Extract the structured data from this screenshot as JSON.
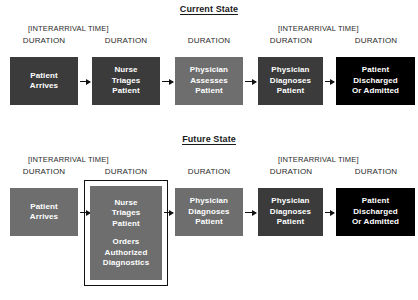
{
  "diagram": {
    "title_current": "Current State",
    "title_future": "Future State",
    "labels": {
      "interarrival": "[INTERARRIVAL TIME]",
      "duration": "DURATION"
    },
    "colors": {
      "box_dark": "#3b3b3b",
      "box_mid": "#6e6e6e",
      "box_black": "#000000",
      "text_on_box": "#ffffff",
      "line": "#111111",
      "background": "#ffffff"
    }
  },
  "current_state": {
    "title": "Current State",
    "interarrival_labels": [
      "[INTERARRIVAL TIME]",
      "[INTERARRIVAL TIME]"
    ],
    "steps": [
      {
        "id": "patient-arrives",
        "duration": "DURATION",
        "lines": [
          "Patient",
          "Arrives"
        ],
        "fill": "#3b3b3b"
      },
      {
        "id": "nurse-triages-patient",
        "duration": "DURATION",
        "lines": [
          "Nurse",
          "Triages",
          "Patient"
        ],
        "fill": "#3b3b3b"
      },
      {
        "id": "physician-assesses-patient",
        "duration": "DURATION",
        "lines": [
          "Physician",
          "Assesses",
          "Patient"
        ],
        "fill": "#6e6e6e"
      },
      {
        "id": "physician-diagnoses-patient",
        "duration": "DURATION",
        "lines": [
          "Physician",
          "Diagnoses",
          "Patient"
        ],
        "fill": "#3b3b3b"
      },
      {
        "id": "patient-discharged-or-admitted",
        "duration": "DURATION",
        "lines": [
          "Patient",
          "Discharged",
          "Or Admitted"
        ],
        "fill": "#000000"
      }
    ]
  },
  "future_state": {
    "title": "Future State",
    "interarrival_labels": [
      "[INTERARRIVAL TIME]",
      "[INTERARRIVAL TIME]"
    ],
    "steps": [
      {
        "id": "patient-arrives",
        "duration": "DURATION",
        "lines": [
          "Patient",
          "Arrives"
        ],
        "fill": "#6e6e6e",
        "highlighted": false
      },
      {
        "id": "nurse-triages-patient-orders-diagnostics",
        "duration": "DURATION",
        "lines": [
          "Nurse",
          "Triages",
          "Patient"
        ],
        "lines2": [
          "Orders",
          "Authorized",
          "Diagnostics"
        ],
        "fill": "#6e6e6e",
        "highlighted": true
      },
      {
        "id": "physician-diagnoses-patient-1",
        "duration": "DURATION",
        "lines": [
          "Physician",
          "Diagnoses",
          "Patient"
        ],
        "fill": "#6e6e6e",
        "highlighted": false
      },
      {
        "id": "physician-diagnoses-patient-2",
        "duration": "DURATION",
        "lines": [
          "Physician",
          "Diagnoses",
          "Patient"
        ],
        "fill": "#3b3b3b",
        "highlighted": false
      },
      {
        "id": "patient-discharged-or-admitted",
        "duration": "DURATION",
        "lines": [
          "Patient",
          "Discharged",
          "Or Admitted"
        ],
        "fill": "#000000",
        "highlighted": false
      }
    ]
  }
}
